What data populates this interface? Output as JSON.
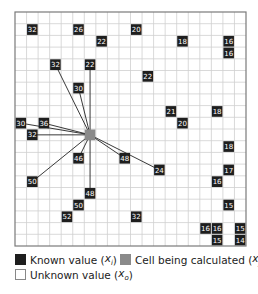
{
  "grid": {
    "cols": 20,
    "rows": 20,
    "x0": 15,
    "y0": 12,
    "cell_w": 11.55,
    "cell_h": 11.7,
    "line_color": "#cfcfcf",
    "border_color": "#7a7a7a"
  },
  "colors": {
    "known": "#1e1e1e",
    "calculated": "#8a8a8a",
    "unknown": "#ffffff",
    "known_text": "#ffffff",
    "connector": "#222222"
  },
  "target_cell": {
    "row": 10,
    "col": 6
  },
  "known_cells": [
    {
      "row": 1,
      "col": 1,
      "value": "32",
      "connected": false
    },
    {
      "row": 1,
      "col": 5,
      "value": "26",
      "connected": false
    },
    {
      "row": 1,
      "col": 10,
      "value": "20",
      "connected": false
    },
    {
      "row": 2,
      "col": 7,
      "value": "22",
      "connected": false
    },
    {
      "row": 2,
      "col": 14,
      "value": "18",
      "connected": false
    },
    {
      "row": 2,
      "col": 18,
      "value": "16",
      "connected": false
    },
    {
      "row": 3,
      "col": 18,
      "value": "16",
      "connected": false
    },
    {
      "row": 4,
      "col": 3,
      "value": "32",
      "connected": true
    },
    {
      "row": 4,
      "col": 6,
      "value": "22",
      "connected": true
    },
    {
      "row": 5,
      "col": 11,
      "value": "22",
      "connected": false
    },
    {
      "row": 6,
      "col": 5,
      "value": "30",
      "connected": true
    },
    {
      "row": 8,
      "col": 13,
      "value": "21",
      "connected": false
    },
    {
      "row": 8,
      "col": 17,
      "value": "18",
      "connected": false
    },
    {
      "row": 9,
      "col": 0,
      "value": "30",
      "connected": true
    },
    {
      "row": 9,
      "col": 2,
      "value": "36",
      "connected": true
    },
    {
      "row": 9,
      "col": 14,
      "value": "20",
      "connected": false
    },
    {
      "row": 10,
      "col": 1,
      "value": "32",
      "connected": true
    },
    {
      "row": 11,
      "col": 18,
      "value": "18",
      "connected": false
    },
    {
      "row": 12,
      "col": 5,
      "value": "46",
      "connected": true
    },
    {
      "row": 12,
      "col": 9,
      "value": "48",
      "connected": true
    },
    {
      "row": 13,
      "col": 12,
      "value": "24",
      "connected": true
    },
    {
      "row": 13,
      "col": 18,
      "value": "17",
      "connected": false
    },
    {
      "row": 14,
      "col": 1,
      "value": "50",
      "connected": true
    },
    {
      "row": 14,
      "col": 17,
      "value": "16",
      "connected": false
    },
    {
      "row": 15,
      "col": 6,
      "value": "48",
      "connected": true
    },
    {
      "row": 16,
      "col": 5,
      "value": "50",
      "connected": false
    },
    {
      "row": 16,
      "col": 18,
      "value": "15",
      "connected": false
    },
    {
      "row": 17,
      "col": 4,
      "value": "52",
      "connected": false
    },
    {
      "row": 17,
      "col": 10,
      "value": "32",
      "connected": false
    },
    {
      "row": 18,
      "col": 16,
      "value": "16",
      "connected": false
    },
    {
      "row": 18,
      "col": 17,
      "value": "16",
      "connected": false
    },
    {
      "row": 18,
      "col": 19,
      "value": "15",
      "connected": false
    },
    {
      "row": 19,
      "col": 17,
      "value": "15",
      "connected": false
    },
    {
      "row": 19,
      "col": 19,
      "value": "14",
      "connected": false
    }
  ],
  "legend": {
    "known": {
      "label": "Known value",
      "var": "x",
      "sub": "i"
    },
    "calculated": {
      "label": "Cell being calculated",
      "var": "x",
      "sub": "j"
    },
    "unknown": {
      "label": "Unknown value",
      "var": "x",
      "sub": "o"
    }
  }
}
